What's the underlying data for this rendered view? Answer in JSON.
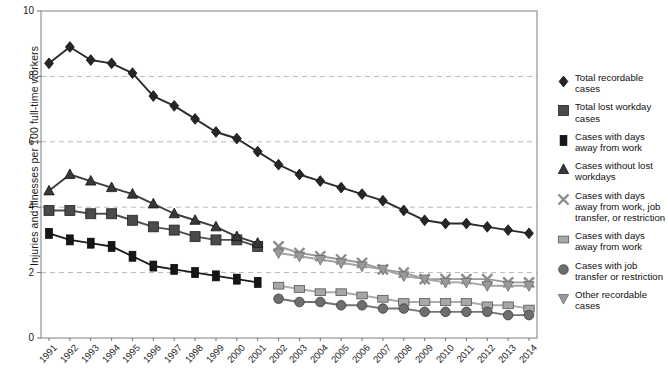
{
  "chart_data": {
    "type": "line",
    "title": "",
    "subtitle": "",
    "xlabel": "",
    "ylabel": "Injuries and illnesses per 100 full-time workers",
    "ylim": [
      0,
      10
    ],
    "yticks": [
      0,
      2,
      4,
      6,
      8,
      10
    ],
    "grid": "horizontal-dashed",
    "legend_position": "right",
    "categories": [
      "1991",
      "1992",
      "1993",
      "1994",
      "1995",
      "1996",
      "1997",
      "1998",
      "1999",
      "2000",
      "2001",
      "2002",
      "2003",
      "2004",
      "2005",
      "2006",
      "2007",
      "2008",
      "2009",
      "2010",
      "2011",
      "2012",
      "2013",
      "2014"
    ],
    "series": [
      {
        "name": "Total recordable cases",
        "marker": "diamond",
        "color": "#262626",
        "values": [
          8.4,
          8.9,
          8.5,
          8.4,
          8.1,
          7.4,
          7.1,
          6.7,
          6.3,
          6.1,
          5.7,
          5.3,
          5.0,
          4.8,
          4.6,
          4.4,
          4.2,
          3.9,
          3.6,
          3.5,
          3.5,
          3.4,
          3.3,
          3.2
        ]
      },
      {
        "name": "Total lost workday cases",
        "marker": "square",
        "color": "#4a4a4a",
        "values": [
          3.9,
          3.9,
          3.8,
          3.8,
          3.6,
          3.4,
          3.3,
          3.1,
          3.0,
          3.0,
          2.8,
          null,
          null,
          null,
          null,
          null,
          null,
          null,
          null,
          null,
          null,
          null,
          null,
          null
        ]
      },
      {
        "name": "Cases with days away from work",
        "marker": "square-small",
        "color": "#161616",
        "values": [
          3.2,
          3.0,
          2.9,
          2.8,
          2.5,
          2.2,
          2.1,
          2.0,
          1.9,
          1.8,
          1.7,
          null,
          null,
          null,
          null,
          null,
          null,
          null,
          null,
          null,
          null,
          null,
          null,
          null
        ]
      },
      {
        "name": "Cases without lost workdays",
        "marker": "triangle-up",
        "color": "#383838",
        "values": [
          4.5,
          5.0,
          4.8,
          4.6,
          4.4,
          4.1,
          3.8,
          3.6,
          3.4,
          3.1,
          2.9,
          null,
          null,
          null,
          null,
          null,
          null,
          null,
          null,
          null,
          null,
          null,
          null,
          null
        ]
      },
      {
        "name": "Cases with days away from work, job transfer, or restriction",
        "marker": "x",
        "color": "#8c8c8c",
        "values": [
          null,
          null,
          null,
          null,
          null,
          null,
          null,
          null,
          null,
          null,
          null,
          2.8,
          2.6,
          2.5,
          2.4,
          2.3,
          2.1,
          2.0,
          1.8,
          1.8,
          1.8,
          1.8,
          1.7,
          1.7
        ]
      },
      {
        "name": "Cases with days away from work",
        "marker": "square-light",
        "color": "#a8a8a8",
        "values": [
          null,
          null,
          null,
          null,
          null,
          null,
          null,
          null,
          null,
          null,
          null,
          1.6,
          1.5,
          1.4,
          1.4,
          1.3,
          1.2,
          1.1,
          1.1,
          1.1,
          1.1,
          1.0,
          1.0,
          0.9
        ]
      },
      {
        "name": "Cases with job transfer or restriction",
        "marker": "circle",
        "color": "#6e6e6e",
        "values": [
          null,
          null,
          null,
          null,
          null,
          null,
          null,
          null,
          null,
          null,
          null,
          1.2,
          1.1,
          1.1,
          1.0,
          1.0,
          0.9,
          0.9,
          0.8,
          0.8,
          0.8,
          0.8,
          0.7,
          0.7
        ]
      },
      {
        "name": "Other recordable cases",
        "marker": "triangle-down",
        "color": "#9a9a9a",
        "values": [
          null,
          null,
          null,
          null,
          null,
          null,
          null,
          null,
          null,
          null,
          null,
          2.6,
          2.5,
          2.4,
          2.3,
          2.2,
          2.1,
          1.9,
          1.8,
          1.7,
          1.7,
          1.6,
          1.6,
          1.6
        ]
      }
    ]
  },
  "axis": {
    "y_label": "Injuries and illnesses per 100 full-time workers",
    "y_ticks": [
      "0",
      "2",
      "4",
      "6",
      "8",
      "10"
    ],
    "x_ticks": [
      "1991",
      "1992",
      "1993",
      "1994",
      "1995",
      "1996",
      "1997",
      "1998",
      "1999",
      "2000",
      "2001",
      "2002",
      "2003",
      "2004",
      "2005",
      "2006",
      "2007",
      "2008",
      "2009",
      "2010",
      "2011",
      "2012",
      "2013",
      "2014"
    ]
  },
  "legend": {
    "items": [
      {
        "label": "Total recordable cases",
        "marker": "diamond-icon",
        "color": "#262626"
      },
      {
        "label": "Total lost workday cases",
        "marker": "square-icon",
        "color": "#4a4a4a"
      },
      {
        "label": "Cases with days away from work",
        "marker": "square-small-icon",
        "color": "#161616"
      },
      {
        "label": "Cases without lost workdays",
        "marker": "triangle-up-icon",
        "color": "#383838"
      },
      {
        "label": "Cases with days away from work, job transfer, or restriction",
        "marker": "x-icon",
        "color": "#8c8c8c"
      },
      {
        "label": "Cases with days away from work",
        "marker": "square-light-icon",
        "color": "#a8a8a8"
      },
      {
        "label": "Cases with job transfer or restriction",
        "marker": "circle-icon",
        "color": "#6e6e6e"
      },
      {
        "label": "Other recordable cases",
        "marker": "triangle-down-icon",
        "color": "#9a9a9a"
      }
    ]
  }
}
